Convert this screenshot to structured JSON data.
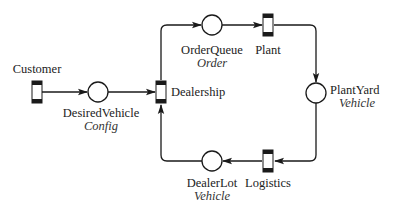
{
  "diagram": {
    "type": "petri-net",
    "colors": {
      "stroke": "#1a1a1a",
      "text": "#222222",
      "background": "#ffffff"
    },
    "transitions": [
      {
        "id": "customer",
        "label": "Customer"
      },
      {
        "id": "dealership",
        "label": "Dealership"
      },
      {
        "id": "plant",
        "label": "Plant"
      },
      {
        "id": "logistics",
        "label": "Logistics"
      }
    ],
    "places": [
      {
        "id": "desired_vehicle",
        "label": "DesiredVehicle",
        "type": "Config"
      },
      {
        "id": "order_queue",
        "label": "OrderQueue",
        "type": "Order"
      },
      {
        "id": "plant_yard",
        "label": "PlantYard",
        "type": "Vehicle"
      },
      {
        "id": "dealer_lot",
        "label": "DealerLot",
        "type": "Vehicle"
      }
    ],
    "arcs": [
      {
        "from": "Customer",
        "to": "DesiredVehicle"
      },
      {
        "from": "DesiredVehicle",
        "to": "Dealership"
      },
      {
        "from": "Dealership",
        "to": "OrderQueue"
      },
      {
        "from": "OrderQueue",
        "to": "Plant"
      },
      {
        "from": "Plant",
        "to": "PlantYard"
      },
      {
        "from": "PlantYard",
        "to": "Logistics"
      },
      {
        "from": "Logistics",
        "to": "DealerLot"
      },
      {
        "from": "DealerLot",
        "to": "Dealership"
      }
    ]
  }
}
